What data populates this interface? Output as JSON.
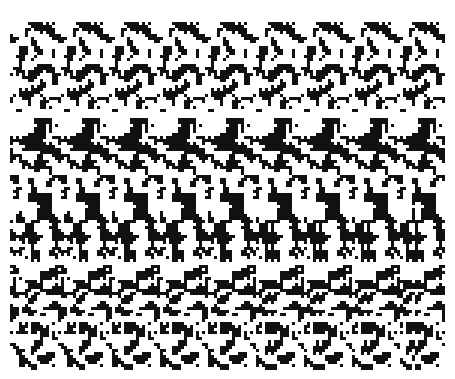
{
  "image": {
    "kind": "random-dot autostereogram",
    "alt": "Black and white random-dot autostereogram with repeating vertical pattern bands",
    "width": 455,
    "height": 379,
    "colors": {
      "ink": "#111111",
      "paper": "#ffffff"
    },
    "pattern_period_px": 48,
    "border": {
      "left": 10,
      "top": 22,
      "right": 12,
      "bottom": 10
    }
  }
}
